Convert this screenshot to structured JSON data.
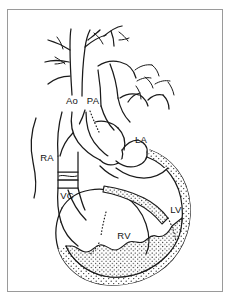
{
  "figure": {
    "view": "anterior",
    "background_color": "#ffffff",
    "line_color": "#1a1a1a",
    "frame_color": "#9a9a9a"
  },
  "labels": [
    {
      "id": "ao",
      "text": "Ao",
      "meaning": "aorta",
      "x": 72,
      "y": 104
    },
    {
      "id": "pa",
      "text": "PA",
      "meaning": "pulmonary artery",
      "x": 92,
      "y": 104
    },
    {
      "id": "ra",
      "text": "RA",
      "meaning": "right atrium",
      "x": 47,
      "y": 161
    },
    {
      "id": "vc",
      "text": "VC",
      "meaning": "vena cava",
      "x": 67,
      "y": 199
    },
    {
      "id": "la",
      "text": "LA",
      "meaning": "left atrium",
      "x": 141,
      "y": 143
    },
    {
      "id": "lv",
      "text": "LV",
      "meaning": "left ventricle",
      "x": 176,
      "y": 213
    },
    {
      "id": "rv",
      "text": "RV",
      "meaning": "right ventricle",
      "x": 124,
      "y": 239
    }
  ],
  "features": {
    "stipple_region": "left ventricular myocardial wall",
    "dotted_lines": "hidden or cut edges behind overlying structures",
    "vessel_branches": "aortic arch branches and pulmonary vein stumps",
    "cava_band": "transverse band across the vena cava"
  }
}
